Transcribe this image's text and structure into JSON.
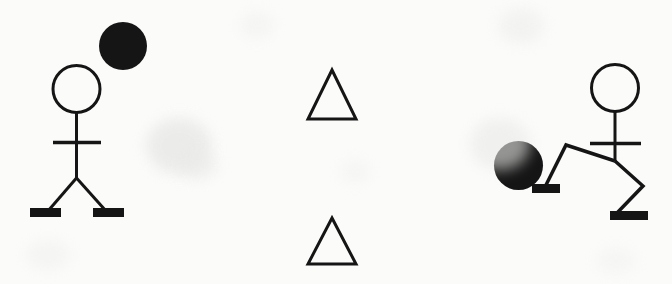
{
  "canvas": {
    "width": 672,
    "height": 284,
    "background_color": "#fbfbfa",
    "ink_color": "#151515",
    "title": "Stick figure kicking a ball"
  },
  "figures": {
    "standing_person": {
      "label": "Standing stick figure with ball in air",
      "head": {
        "cx": 76.5,
        "cy": 89,
        "r": 23.5,
        "fill": "none",
        "stroke_width": 3
      },
      "ball": {
        "cx": 123,
        "cy": 46,
        "r": 24,
        "fill": "#151515"
      },
      "neck": {
        "x1": 76.5,
        "y1": 112.5,
        "x2": 76.5,
        "y2": 142
      },
      "spine": {
        "x1": 76.5,
        "y1": 142,
        "x2": 76.5,
        "y2": 178
      },
      "arms": {
        "x1": 53,
        "y1": 142.5,
        "x2": 101,
        "y2": 142.5,
        "stroke_width": 3.5
      },
      "left_leg": {
        "x1": 76.5,
        "y1": 178,
        "x2": 48,
        "y2": 211
      },
      "right_leg": {
        "x1": 76.5,
        "y1": 178,
        "x2": 106,
        "y2": 211
      },
      "left_foot": {
        "x1": 30,
        "y1": 212.5,
        "x2": 61,
        "y2": 212.5,
        "stroke_width": 9
      },
      "right_foot": {
        "x1": 93,
        "y1": 212.5,
        "x2": 124,
        "y2": 212.5,
        "stroke_width": 9
      }
    },
    "kicking_person": {
      "label": "Stick figure kicking a ball",
      "head": {
        "cx": 615,
        "cy": 88,
        "r": 23.5,
        "fill": "none",
        "stroke_width": 3
      },
      "ball": {
        "cx": 518.5,
        "cy": 165.5,
        "r": 24.5,
        "fill": "#151515"
      },
      "neck": {
        "x1": 615,
        "y1": 111.5,
        "x2": 615,
        "y2": 143
      },
      "spine": {
        "x1": 615,
        "y1": 143,
        "x2": 615,
        "y2": 161
      },
      "arms": {
        "x1": 590,
        "y1": 143.5,
        "x2": 641,
        "y2": 143.5,
        "stroke_width": 3.5
      },
      "kicking_thigh": {
        "x1": 615,
        "y1": 161,
        "x2": 566,
        "y2": 145
      },
      "kicking_shin": {
        "x1": 566,
        "y1": 145,
        "x2": 545,
        "y2": 187
      },
      "support_thigh": {
        "x1": 615,
        "y1": 161,
        "x2": 643,
        "y2": 186
      },
      "support_shin": {
        "x1": 643,
        "y1": 186,
        "x2": 616,
        "y2": 214
      },
      "kicking_foot": {
        "x1": 532,
        "y1": 188.5,
        "x2": 560,
        "y2": 188.5,
        "stroke_width": 9
      },
      "support_foot": {
        "x1": 610,
        "y1": 215.5,
        "x2": 648,
        "y2": 215.5,
        "stroke_width": 9
      }
    }
  },
  "shapes": {
    "top_triangle": {
      "label": "Outlined triangle (upper)",
      "points": "332,70 356,119 308,119",
      "fill": "none",
      "stroke_width": 3
    },
    "bottom_triangle": {
      "label": "Outlined triangle (lower)",
      "points": "332,218 356,264 308,264",
      "fill": "none",
      "stroke_width": 3
    }
  },
  "chart_data": {
    "type": "table",
    "categories": [
      "standing-figure",
      "ball-in-air",
      "upper-triangle",
      "lower-triangle",
      "kicking-figure",
      "ball-at-foot"
    ],
    "values": [
      1,
      1,
      1,
      1,
      1,
      1
    ]
  }
}
